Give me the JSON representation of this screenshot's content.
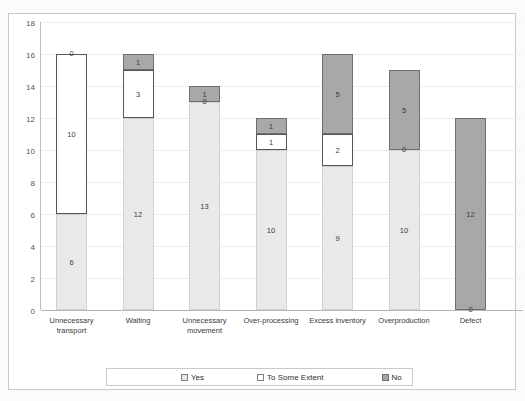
{
  "chart_data": {
    "type": "bar",
    "stacked": true,
    "title": "",
    "xlabel": "",
    "ylabel": "",
    "ylim": [
      0,
      18
    ],
    "ytick_step": 2,
    "yticks": [
      0,
      2,
      4,
      6,
      8,
      10,
      12,
      14,
      16,
      18
    ],
    "grid": true,
    "legend_position": "bottom",
    "categories": [
      "Unnecessary transport",
      "Waiting",
      "Unnecessary movement",
      "Over-processing",
      "Excess inventory",
      "Overproduction",
      "Defect"
    ],
    "series": [
      {
        "name": "Yes",
        "color": "#e9e9e9",
        "values": [
          6,
          12,
          13,
          10,
          9,
          10,
          0
        ]
      },
      {
        "name": "To Some Extent",
        "color": "#ffffff",
        "values": [
          10,
          3,
          0,
          1,
          2,
          0,
          0
        ]
      },
      {
        "name": "No",
        "color": "#a8a8a8",
        "values": [
          0,
          1,
          1,
          1,
          5,
          5,
          12
        ]
      }
    ],
    "totals": [
      16,
      16,
      14,
      12,
      16,
      15,
      12
    ]
  },
  "axis": {
    "yticks": [
      "18",
      "16",
      "14",
      "12",
      "10",
      "8",
      "6",
      "4",
      "2",
      "0"
    ]
  },
  "categories": [
    {
      "line1": "Unnecessary",
      "line2": "transport"
    },
    {
      "line1": "Waiting",
      "line2": ""
    },
    {
      "line1": "Unnecessary",
      "line2": "movement"
    },
    {
      "line1": "Over-processing",
      "line2": ""
    },
    {
      "line1": "Excess inventory",
      "line2": ""
    },
    {
      "line1": "Overproduction",
      "line2": ""
    },
    {
      "line1": "Defect",
      "line2": ""
    }
  ],
  "bars": [
    {
      "yes": "6",
      "some": "10",
      "no": "0",
      "yes_v": 6,
      "some_v": 10,
      "no_v": 0
    },
    {
      "yes": "12",
      "some": "3",
      "no": "1",
      "yes_v": 12,
      "some_v": 3,
      "no_v": 1
    },
    {
      "yes": "13",
      "some": "0",
      "no": "1",
      "yes_v": 13,
      "some_v": 0,
      "no_v": 1
    },
    {
      "yes": "10",
      "some": "1",
      "no": "1",
      "yes_v": 10,
      "some_v": 1,
      "no_v": 1
    },
    {
      "yes": "9",
      "some": "2",
      "no": "5",
      "yes_v": 9,
      "some_v": 2,
      "no_v": 5
    },
    {
      "yes": "10",
      "some": "0",
      "no": "5",
      "yes_v": 10,
      "some_v": 0,
      "no_v": 5
    },
    {
      "yes": "0",
      "some": "0",
      "no": "12",
      "yes_v": 0,
      "some_v": 0,
      "no_v": 12
    }
  ],
  "legend": {
    "items": [
      {
        "label": "Yes"
      },
      {
        "label": "To Some Extent"
      },
      {
        "label": "No"
      }
    ]
  }
}
